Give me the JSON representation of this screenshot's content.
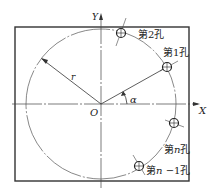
{
  "diagram": {
    "title": "",
    "axes": {
      "x_label": "X",
      "y_label": "Y",
      "origin_label": "O"
    },
    "radius_label": "r",
    "angle_label": "α",
    "holes": [
      {
        "label": "第2孔",
        "id": "hole-2"
      },
      {
        "label": "第1孔",
        "id": "hole-1"
      },
      {
        "label_prefix": "第",
        "label_var": "n",
        "label_suffix": "孔",
        "id": "hole-n"
      },
      {
        "label_prefix": "第",
        "label_var": "n",
        "label_mid": " −1",
        "label_suffix": "孔",
        "id": "hole-n-minus-1"
      }
    ],
    "colors": {
      "stroke": "#333333",
      "background": "#ffffff"
    }
  }
}
